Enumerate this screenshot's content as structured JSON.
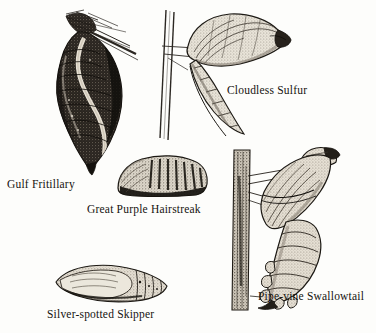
{
  "plate": {
    "title": "Butterfly Chrysalides",
    "background_color": "#fdfdfb",
    "ink_color": "#15130f",
    "medium": "engraving",
    "figure_count": 5
  },
  "figures": [
    {
      "id": "gulf-fritillary",
      "caption": "Gulf Fritillary",
      "posture": "hanging head-down from twig",
      "shading": "dark, heavily stippled with pale sinuous highlight",
      "support": "thin diagonal twig at upper right"
    },
    {
      "id": "cloudless-sulfur",
      "caption": "Cloudless Sulfur",
      "posture": "upright, girdled to vertical stem",
      "shading": "light stipple with curved ridge lines",
      "support": "vertical stem with horizontal silk girdle"
    },
    {
      "id": "great-purple-hairstreak",
      "caption": "Great Purple Hairstreak",
      "posture": "squat dome resting horizontally",
      "shading": "mottled with dark banded abdomen",
      "support": "none"
    },
    {
      "id": "silver-spotted-skipper",
      "caption": "Silver-spotted Skipper",
      "posture": "elongated, lying horizontally",
      "shading": "pale stipple, segmented abdomen",
      "support": "none"
    },
    {
      "id": "pipe-vine-swallowtail",
      "caption": "Pipe-vine Swallowtail",
      "posture": "upright, girdled to vertical twig",
      "shading": "light stipple with scalloped lateral flanges",
      "support": "vertical textured twig with silk girdle"
    }
  ]
}
